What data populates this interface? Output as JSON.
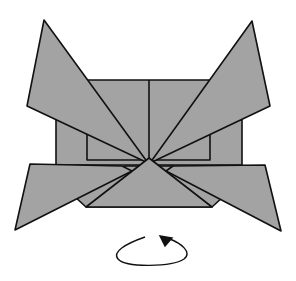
{
  "diagram": {
    "type": "origami-fold-step",
    "colors": {
      "paper": "#a3a3a3",
      "stroke": "#111111",
      "background": "#ffffff"
    },
    "annotations": [
      {
        "kind": "turn-over-arrow",
        "meaning": "turn model over"
      }
    ]
  }
}
